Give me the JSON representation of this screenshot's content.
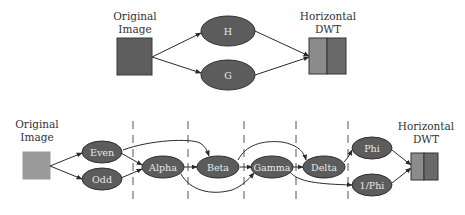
{
  "colors": {
    "node_fill": "#5c5c5c",
    "node_stroke": "#2e2e2e",
    "node_text": "#e8e8e8",
    "top_image_fill": "#5e5e5e",
    "bottom_image_fill": "#9a9a9a",
    "dwt_low": "#8c8c8c",
    "dwt_high": "#6a6a6a",
    "edge": "#2a2a2a"
  },
  "top_diagram": {
    "input": {
      "label_line1": "Original",
      "label_line2": "Image"
    },
    "filters": [
      {
        "id": "H",
        "label": "H"
      },
      {
        "id": "G",
        "label": "G"
      }
    ],
    "output": {
      "label_line1": "Horizontal",
      "label_line2": "DWT"
    }
  },
  "bottom_diagram": {
    "input": {
      "label_line1": "Original",
      "label_line2": "Image"
    },
    "nodes": [
      {
        "id": "even",
        "label": "Even"
      },
      {
        "id": "odd",
        "label": "Odd"
      },
      {
        "id": "alpha",
        "label": "Alpha"
      },
      {
        "id": "beta",
        "label": "Beta"
      },
      {
        "id": "gamma",
        "label": "Gamma"
      },
      {
        "id": "delta",
        "label": "Delta"
      },
      {
        "id": "phi",
        "label": "Phi"
      },
      {
        "id": "inv_phi",
        "label": "1/Phi"
      }
    ],
    "output": {
      "label_line1": "Horizontal",
      "label_line2": "DWT"
    },
    "edges": [
      [
        "input",
        "even"
      ],
      [
        "input",
        "odd"
      ],
      [
        "even",
        "alpha"
      ],
      [
        "odd",
        "alpha"
      ],
      [
        "even",
        "beta"
      ],
      [
        "alpha",
        "beta"
      ],
      [
        "alpha",
        "gamma"
      ],
      [
        "beta",
        "gamma"
      ],
      [
        "beta",
        "delta"
      ],
      [
        "gamma",
        "delta"
      ],
      [
        "gamma",
        "inv_phi"
      ],
      [
        "delta",
        "phi"
      ],
      [
        "phi",
        "output"
      ],
      [
        "inv_phi",
        "output"
      ]
    ],
    "stage_separators": 5
  }
}
